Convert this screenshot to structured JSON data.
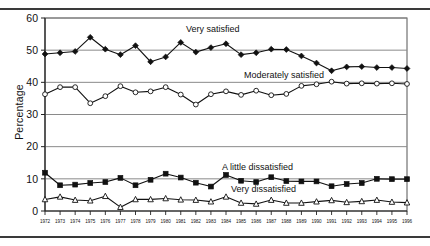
{
  "chart_data": {
    "type": "line",
    "title": "",
    "xlabel": "",
    "ylabel": "Percentage",
    "ylim": [
      0,
      60
    ],
    "yticks": [
      0,
      10,
      20,
      30,
      40,
      50,
      60
    ],
    "grid": true,
    "legend_position": "inline-annotations",
    "x": [
      1972,
      1973,
      1974,
      1975,
      1976,
      1977,
      1978,
      1979,
      1980,
      1981,
      1982,
      1983,
      1984,
      1985,
      1986,
      1987,
      1988,
      1989,
      1990,
      1991,
      1992,
      1993,
      1994,
      1995,
      1996
    ],
    "xtick_labels": [
      "1972",
      "1973",
      "1974",
      "1975",
      "1976",
      "1977",
      "1978",
      "1979",
      "1980",
      "1981",
      "1982",
      "1983",
      "1984",
      "1985",
      "1986",
      "1987",
      "1988",
      "1989",
      "1990",
      "1991",
      "1992",
      "1993",
      "1994",
      "1995",
      "1996"
    ],
    "series": [
      {
        "name": "Very satisfied",
        "marker": "filled-diamond",
        "values": [
          48.8,
          49.2,
          49.6,
          54.0,
          50.3,
          48.6,
          51.4,
          46.4,
          47.9,
          52.4,
          49.4,
          50.8,
          52.0,
          48.6,
          49.2,
          50.3,
          50.2,
          48.2,
          46.0,
          43.6,
          44.8,
          44.9,
          44.6,
          44.6,
          44.3
        ]
      },
      {
        "name": "Moderately satisfied",
        "marker": "open-circle",
        "values": [
          36.3,
          38.5,
          38.5,
          33.5,
          35.7,
          38.8,
          36.9,
          37.2,
          38.5,
          36.2,
          33.1,
          36.3,
          37.2,
          36.1,
          37.4,
          36.0,
          36.4,
          38.9,
          39.4,
          40.2,
          39.6,
          39.7,
          39.6,
          39.7,
          39.5
        ]
      },
      {
        "name": "A little dissatisfied",
        "marker": "filled-square",
        "values": [
          11.9,
          8.0,
          8.2,
          8.7,
          9.0,
          10.3,
          8.0,
          9.7,
          11.6,
          10.4,
          8.8,
          7.6,
          11.2,
          9.4,
          9.0,
          10.5,
          9.3,
          9.2,
          9.2,
          7.7,
          8.4,
          8.7,
          10.0,
          9.9,
          9.9
        ]
      },
      {
        "name": "Very dissatisfied",
        "marker": "open-triangle",
        "values": [
          3.6,
          4.4,
          3.4,
          3.2,
          4.6,
          1.2,
          3.6,
          3.6,
          3.9,
          3.5,
          3.4,
          2.9,
          4.4,
          2.5,
          2.2,
          3.4,
          2.5,
          2.5,
          2.9,
          3.3,
          2.7,
          3.0,
          3.4,
          2.8,
          2.6
        ]
      }
    ],
    "annotations": [
      {
        "text": "Very satisfied",
        "x_px": 186,
        "y_px": 22
      },
      {
        "text": "Moderately satisfied",
        "x_px": 244,
        "y_px": 68
      },
      {
        "text": "A little dissatisfied",
        "x_px": 222,
        "y_px": 160
      },
      {
        "text": "Very dissatisfied",
        "x_px": 231,
        "y_px": 182
      }
    ]
  }
}
